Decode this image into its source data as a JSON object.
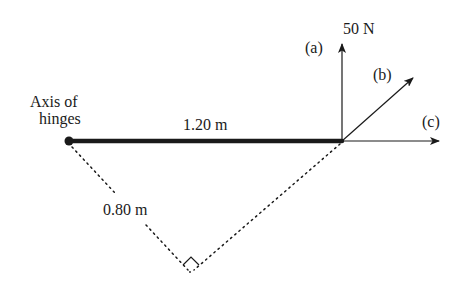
{
  "diagram": {
    "hinge_label_line1": "Axis of",
    "hinge_label_line2": "hinges",
    "door_width_label": "1.20 m",
    "perpendicular_distance_label": "0.80 m",
    "force_magnitude_label": "50 N",
    "force_labels": {
      "a": "(a)",
      "b": "(b)",
      "c": "(c)"
    },
    "colors": {
      "ink": "#1a1a1a",
      "background": "#ffffff"
    }
  }
}
